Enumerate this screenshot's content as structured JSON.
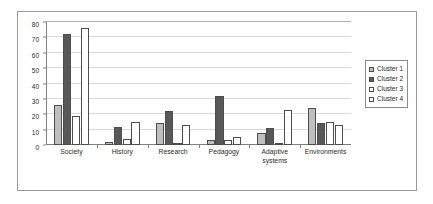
{
  "chart_data": {
    "type": "bar",
    "title": "",
    "subtitle": "",
    "xlabel": "",
    "ylabel": "",
    "ylim": [
      0,
      80
    ],
    "yticks": [
      0,
      10,
      20,
      30,
      40,
      50,
      60,
      70,
      80
    ],
    "ytick_labels": [
      "0",
      "10",
      "20",
      "30",
      "40",
      "50",
      "60",
      "70",
      "80"
    ],
    "grid": true,
    "grid_axis": "y",
    "legend_position": "right",
    "categories": [
      "Society",
      "History",
      "Research",
      "Pedagogy",
      "Adaptive systems",
      "Environments"
    ],
    "category_labels": [
      "Society",
      "History",
      "Research",
      "Pedagogy",
      "Adaptive\nsystems",
      "Environments"
    ],
    "series": [
      {
        "name": "Cluster 1",
        "color": "#bfbfbf",
        "values": [
          26,
          2,
          14,
          3,
          8,
          24
        ]
      },
      {
        "name": "Cluster 2",
        "color": "#585858",
        "values": [
          72,
          12,
          22,
          32,
          11,
          14
        ]
      },
      {
        "name": "Cluster 3",
        "color": "#ffffff",
        "values": [
          19,
          4,
          1,
          3,
          1,
          15
        ]
      },
      {
        "name": "Cluster 4",
        "color": "#ffffff",
        "values": [
          76,
          15,
          13,
          5,
          23,
          13
        ]
      }
    ]
  },
  "legend": {
    "entries": [
      {
        "label": "Cluster 1"
      },
      {
        "label": "Cluster 2"
      },
      {
        "label": "Cluster 3"
      },
      {
        "label": "Cluster 4"
      }
    ]
  }
}
